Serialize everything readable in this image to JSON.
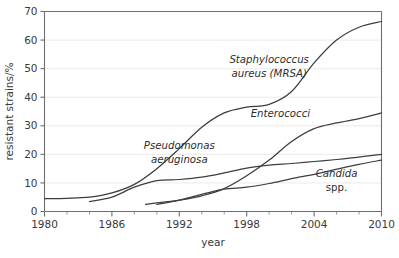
{
  "chart_data": {
    "type": "line",
    "title": "",
    "xlabel": "year",
    "ylabel": "resistant strains/%",
    "xlim": [
      1980,
      2010
    ],
    "ylim": [
      0,
      70
    ],
    "grid": true,
    "legend_position": "inline-annotations",
    "x_ticks": [
      1980,
      1986,
      1992,
      1998,
      2004,
      2010
    ],
    "x_tick_labels": [
      "1980",
      "1986",
      "1992",
      "1998",
      "2004",
      "2010"
    ],
    "x_minor_ticks": [
      1982,
      1984,
      1988,
      1990,
      1994,
      1996,
      2000,
      2002,
      2006,
      2008
    ],
    "y_ticks": [
      0,
      10,
      20,
      30,
      40,
      50,
      60,
      70
    ],
    "y_tick_labels": [
      "0",
      "10",
      "20",
      "30",
      "40",
      "50",
      "60",
      "70"
    ],
    "series": [
      {
        "name": "Staphylococcus aureus (MRSA)",
        "label_line1": "Staphylococcus",
        "label_line2": "aureus (MRSA)",
        "color": "#3d3d3d",
        "x": [
          1980,
          1982,
          1984,
          1986,
          1988,
          1990,
          1992,
          1994,
          1996,
          1998,
          2000,
          2002,
          2004,
          2006,
          2008,
          2010
        ],
        "values": [
          4.5,
          4.6,
          5.0,
          6.5,
          9.5,
          15.0,
          22.0,
          29.5,
          34.5,
          36.5,
          37.5,
          42.0,
          52.0,
          60.0,
          64.5,
          66.5
        ]
      },
      {
        "name": "Pseudomonas aeruginosa",
        "label_line1": "Pseudomonas",
        "label_line2": "aeruginosa",
        "color": "#3d3d3d",
        "x": [
          1984,
          1986,
          1988,
          1990,
          1992,
          1994,
          1996,
          1998,
          2000,
          2002,
          2004,
          2006,
          2008,
          2010
        ],
        "values": [
          3.5,
          5.0,
          8.5,
          10.8,
          11.2,
          12.0,
          13.5,
          15.2,
          16.2,
          16.8,
          17.5,
          18.2,
          19.0,
          20.0
        ]
      },
      {
        "name": "Enterococci",
        "label_line1": "Enterococci",
        "label_line2": "",
        "color": "#3d3d3d",
        "x": [
          1989,
          1990,
          1992,
          1994,
          1996,
          1998,
          2000,
          2002,
          2004,
          2006,
          2008,
          2010
        ],
        "values": [
          2.5,
          3.0,
          4.0,
          5.5,
          8.0,
          12.5,
          18.0,
          24.5,
          29.0,
          31.0,
          32.5,
          34.5
        ]
      },
      {
        "name": "Candida spp.",
        "label_line1": "Candida",
        "label_line2": "spp.",
        "color": "#3d3d3d",
        "x": [
          1990,
          1992,
          1994,
          1996,
          1998,
          2000,
          2002,
          2004,
          2006,
          2008,
          2010
        ],
        "values": [
          2.5,
          4.0,
          6.0,
          7.8,
          8.5,
          9.8,
          11.5,
          13.0,
          14.8,
          16.5,
          18.0
        ]
      }
    ],
    "annotations": [
      {
        "text": "Staphylococcus aureus (MRSA)",
        "x": 2000,
        "y": 52
      },
      {
        "text": "Pseudomonas aeruginosa",
        "x": 1992,
        "y": 22
      },
      {
        "text": "Enterococci",
        "x": 2001,
        "y": 33
      },
      {
        "text": "Candida spp.",
        "x": 2006,
        "y": 12
      }
    ]
  }
}
